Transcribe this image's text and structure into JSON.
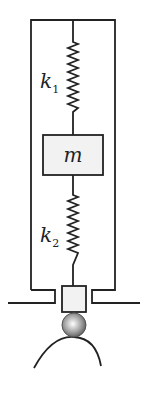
{
  "diagram": {
    "labels": {
      "k1": {
        "base": "k",
        "sub": "1"
      },
      "k2": {
        "base": "k",
        "sub": "2"
      },
      "mass": "m"
    },
    "colors": {
      "stroke": "#222222",
      "fill": "#f2f2f2"
    }
  }
}
